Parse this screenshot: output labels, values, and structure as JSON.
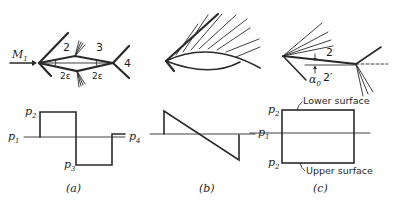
{
  "panel_a": {
    "caption": "(a)",
    "flow_label": "M",
    "flow_sub": "1",
    "regions": [
      "2",
      "3",
      "4"
    ],
    "angle_label": "2ε",
    "pressures": {
      "p2": {
        "sym": "p",
        "sub": "2"
      },
      "p1": {
        "sym": "p",
        "sub": "1"
      },
      "p3": {
        "sym": "p",
        "sub": "3"
      },
      "p4": {
        "sym": "p",
        "sub": "4"
      }
    }
  },
  "panel_b": {
    "caption": "(b)",
    "pressure_left": {
      "sym": "p",
      "sub": "1"
    }
  },
  "panel_c": {
    "caption": "(c)",
    "region_upper": "2",
    "region_lower": "2′",
    "angle_label": "α",
    "angle_sub": "0",
    "lower_surface_label": "Lower surface",
    "upper_surface_label": "Upper surface",
    "pressures": {
      "top": {
        "sym": "p",
        "sub": "2"
      },
      "mid": {
        "sym": "p",
        "sub": "1"
      },
      "bottom": {
        "sym": "p",
        "sub": "2"
      }
    }
  }
}
